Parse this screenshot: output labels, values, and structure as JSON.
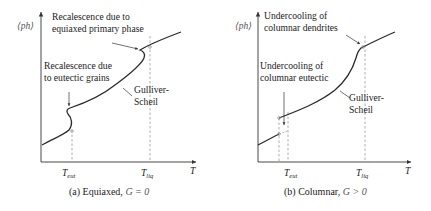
{
  "panels": [
    {
      "id": "a",
      "caption": "(a) Equiaxed, ",
      "caption_math": "G = 0",
      "y_axis_label": "⟨ph⟩",
      "x_axis_label": "T",
      "tick_labels": {
        "t_eut": "T",
        "t_eut_sub": "eut",
        "t_liq": "T",
        "t_liq_sub": "liq"
      },
      "annotations": {
        "top_line1": "Recalescence due to",
        "top_line2": "equiaxed primary phase",
        "mid_line1": "Recalescence due",
        "mid_line2": "to eutectic grains",
        "gs_line1": "Gulliver-",
        "gs_line2": "Scheil"
      }
    },
    {
      "id": "b",
      "caption": "(b) Columnar, ",
      "caption_math": "G > 0",
      "y_axis_label": "⟨ph⟩",
      "x_axis_label": "T",
      "tick_labels": {
        "t_eut": "T",
        "t_eut_sub": "eut",
        "t_liq": "T",
        "t_liq_sub": "liq"
      },
      "annotations": {
        "top_line1": "Undercooling of",
        "top_line2": "columnar dendrites",
        "mid_line1": "Undercooling of",
        "mid_line2": "columnar eutectic",
        "gs_line1": "Gulliver-",
        "gs_line2": "Scheil"
      }
    }
  ],
  "colors": {
    "curve": "#2a2a2a",
    "axis": "#333333",
    "dashed": "#9a9a9a",
    "text": "#222222"
  }
}
